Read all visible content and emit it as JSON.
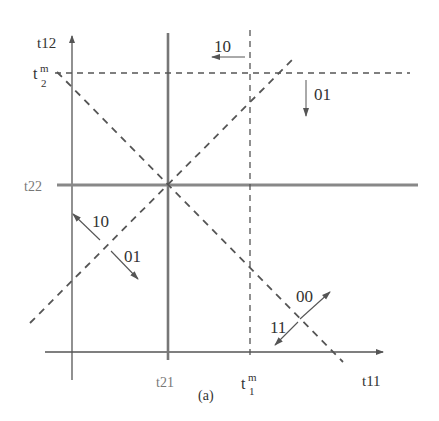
{
  "figure": {
    "caption": "(a)",
    "axes": {
      "x_label": "t11",
      "y_label": "t12"
    },
    "ticks": {
      "t21": "t21",
      "t22": "t22",
      "t1m_base": "t",
      "t1m_sup": "m",
      "t1m_sub": "1",
      "t2m_base": "t",
      "t2m_sup": "m",
      "t2m_sub": "2"
    },
    "arrows": [
      {
        "label": "10",
        "direction": "left",
        "location": "top, left of t1m"
      },
      {
        "label": "01",
        "direction": "down",
        "location": "right of t1m, below t2m"
      },
      {
        "label": "10",
        "direction": "up-left",
        "location": "lower-left region"
      },
      {
        "label": "01",
        "direction": "down-right",
        "location": "lower-left region"
      },
      {
        "label": "00",
        "direction": "up-right",
        "location": "lower-right region"
      },
      {
        "label": "11",
        "direction": "down-left",
        "location": "lower-right region"
      }
    ],
    "lines": {
      "solid": [
        "t21 vertical",
        "t22 horizontal"
      ],
      "dashed": [
        "t1m vertical",
        "t2m horizontal",
        "descending diagonal",
        "ascending diagonal"
      ]
    },
    "colors": {
      "line": "#555555",
      "solid_gray": "#888888",
      "text": "#333333"
    }
  }
}
